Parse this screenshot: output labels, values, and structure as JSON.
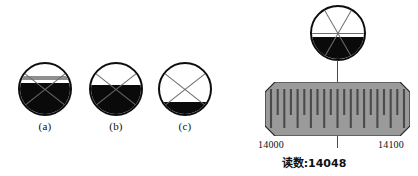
{
  "figure": {
    "title": "",
    "background_color": "#ffffff",
    "ink_color": "#0a0a0a",
    "bar_color": "#999999",
    "tick_color": "#4f4f4f"
  },
  "bubbles": {
    "items": [
      {
        "label": "(a)",
        "name": "bubble-a",
        "left": 18,
        "top": 62,
        "fill_percent": 70,
        "band_top_percent": 24,
        "band_height_percent": 7,
        "has_band": true
      },
      {
        "label": "(b)",
        "name": "bubble-b",
        "left": 89,
        "top": 62,
        "fill_percent": 66,
        "band_top_percent": 0,
        "band_height_percent": 0,
        "has_band": false
      },
      {
        "label": "(c)",
        "name": "bubble-c",
        "left": 158,
        "top": 62,
        "fill_percent": 33,
        "band_top_percent": 0,
        "band_height_percent": 0,
        "has_band": false
      }
    ]
  },
  "dial": {
    "name": "micrometer-dial",
    "fill_percent": 50,
    "spoke_count": 6
  },
  "scale": {
    "left_label": "14000",
    "right_label": "14100",
    "reading_label": "读数:14048",
    "pointer_value": 14048,
    "min": 14000,
    "max": 14100,
    "major_tick_count": 11,
    "minor_tick_count": 10
  },
  "chart_data": {
    "type": "table",
    "categories": [
      "(a)",
      "(b)",
      "(c)"
    ],
    "values": [
      70,
      66,
      33
    ],
    "xlabel": "",
    "ylabel": "",
    "annotations": [
      "14000",
      "14100",
      "读数:14048"
    ]
  }
}
